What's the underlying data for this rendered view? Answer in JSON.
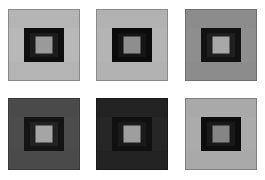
{
  "figure": {
    "background_color": "#ffffff",
    "layout": {
      "rows": 2,
      "columns": 3,
      "panel_count": 6,
      "panel_size_px": 72
    }
  },
  "panels": [
    {
      "id": "panel-1",
      "position": "top-left",
      "label": "A",
      "band_top_color": "#b5b5b5",
      "band_bottom_color": "#b5b5b5",
      "band_middle_color": "#b8b8b8",
      "inner_frame_color": "#0e0e0e",
      "inner_ring_color": "#1c1c1c",
      "center_patch_color": "#9a9a9a",
      "border_color": "#8a8a8a"
    },
    {
      "id": "panel-2",
      "position": "top-center",
      "label": "B",
      "band_top_color": "#b2b2b2",
      "band_bottom_color": "#b2b2b2",
      "band_middle_color": "#b4b4b4",
      "inner_frame_color": "#0b0b0b",
      "inner_ring_color": "#151515",
      "center_patch_color": "#8e8e8e",
      "border_color": "#8a8a8a"
    },
    {
      "id": "panel-3",
      "position": "top-right",
      "label": "C",
      "band_top_color": "#8c8c8c",
      "band_bottom_color": "#8c8c8c",
      "band_middle_color": "#8e8e8e",
      "inner_frame_color": "#121212",
      "inner_ring_color": "#1f1f1f",
      "center_patch_color": "#a8a8a8",
      "border_color": "#6f6f6f"
    },
    {
      "id": "panel-4",
      "position": "bottom-left",
      "label": "D",
      "band_top_color": "#4a4a4a",
      "band_bottom_color": "#4a4a4a",
      "band_middle_color": "#4c4c4c",
      "inner_frame_color": "#141414",
      "inner_ring_color": "#222222",
      "center_patch_color": "#a5a5a5",
      "border_color": "#3b3b3b"
    },
    {
      "id": "panel-5",
      "position": "bottom-center",
      "label": "E",
      "band_top_color": "#232323",
      "band_bottom_color": "#232323",
      "band_middle_color": "#262626",
      "inner_frame_color": "#101010",
      "inner_ring_color": "#1a1a1a",
      "center_patch_color": "#9e9e9e",
      "border_color": "#1a1a1a"
    },
    {
      "id": "panel-6",
      "position": "bottom-right",
      "label": "F",
      "band_top_color": "#a9a9a9",
      "band_bottom_color": "#a9a9a9",
      "band_middle_color": "#ababab",
      "inner_frame_color": "#0d0d0d",
      "inner_ring_color": "#191919",
      "center_patch_color": "#858585",
      "border_color": "#808080"
    }
  ]
}
